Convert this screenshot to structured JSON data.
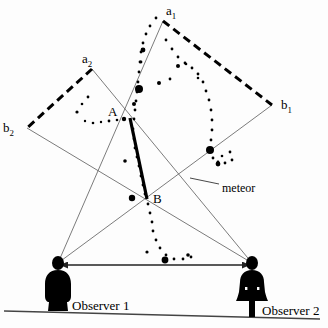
{
  "figure": {
    "background_color": "#fdfdfd",
    "ink_color": "#000000",
    "sightline_color": "#555555"
  },
  "labels": {
    "a1": {
      "base": "a",
      "sub": "1",
      "x": 166,
      "y": 4
    },
    "a2": {
      "base": "a",
      "sub": "2",
      "x": 82,
      "y": 52
    },
    "b1": {
      "base": "b",
      "sub": "1",
      "x": 281,
      "y": 98
    },
    "b2": {
      "base": "b",
      "sub": "2",
      "x": 3,
      "y": 121
    },
    "point_a": {
      "text": "A",
      "x": 108,
      "y": 105
    },
    "point_b": {
      "text": "B",
      "x": 153,
      "y": 192
    },
    "meteor": {
      "text": "meteor",
      "x": 222,
      "y": 182
    },
    "observer1": {
      "text": "Observer 1",
      "x": 72,
      "y": 299
    },
    "observer2": {
      "text": "Observer 2",
      "x": 262,
      "y": 304
    }
  },
  "geometry": {
    "observer1_head": {
      "x": 58,
      "y": 263
    },
    "observer2_head": {
      "x": 252,
      "y": 263
    },
    "point_a": {
      "x": 128,
      "y": 117
    },
    "point_b": {
      "x": 146,
      "y": 198
    },
    "vertex_a1": {
      "x": 163,
      "y": 21
    },
    "vertex_a2": {
      "x": 92,
      "y": 69
    },
    "vertex_b1": {
      "x": 272,
      "y": 105
    },
    "vertex_b2": {
      "x": 27,
      "y": 128
    },
    "ground_line": {
      "x1": 4,
      "y1": 311,
      "x2": 320,
      "y2": 319
    },
    "baseline_arrow": {
      "x1": 68,
      "y1": 265,
      "x2": 242,
      "y2": 265
    },
    "meteor_track": {
      "x1": 130,
      "y1": 118,
      "x2": 147,
      "y2": 199
    },
    "meteor_leader": {
      "x1": 190,
      "y1": 178,
      "x2": 219,
      "y2": 184
    }
  },
  "meteor_path_1": {
    "description": "dotted trail seen against background star field 1",
    "points": [
      [
        156,
        18
      ],
      [
        150,
        26
      ],
      [
        146,
        34
      ],
      [
        143,
        43
      ],
      [
        141,
        52
      ],
      [
        140,
        62
      ],
      [
        139,
        72
      ],
      [
        138,
        82
      ],
      [
        137,
        92
      ],
      [
        136,
        101
      ],
      [
        135,
        110
      ],
      [
        134,
        119
      ],
      [
        133,
        129
      ],
      [
        134,
        139
      ],
      [
        135,
        148
      ],
      [
        137,
        157
      ],
      [
        139,
        166
      ],
      [
        141,
        176
      ],
      [
        143,
        185
      ],
      [
        145,
        194
      ],
      [
        148,
        204
      ],
      [
        150,
        213
      ],
      [
        152,
        222
      ],
      [
        153,
        231
      ],
      [
        156,
        240
      ],
      [
        160,
        248
      ],
      [
        166,
        255
      ],
      [
        174,
        259
      ],
      [
        183,
        259
      ],
      [
        191,
        257
      ]
    ]
  },
  "meteor_path_2": {
    "description": "dotted trail for second viewpoint, toward right",
    "points": [
      [
        166,
        40
      ],
      [
        172,
        49
      ],
      [
        178,
        57
      ],
      [
        185,
        63
      ],
      [
        192,
        68
      ],
      [
        198,
        74
      ],
      [
        203,
        82
      ],
      [
        206,
        91
      ],
      [
        209,
        100
      ],
      [
        211,
        110
      ],
      [
        212,
        120
      ],
      [
        212,
        130
      ],
      [
        211,
        140
      ],
      [
        210,
        150
      ],
      [
        213,
        158
      ],
      [
        218,
        162
      ],
      [
        225,
        163
      ],
      [
        232,
        160
      ]
    ]
  },
  "star_field_1": {
    "description": "stars near left constellation (a2-b2 region)",
    "stars": [
      {
        "x": 88,
        "y": 97,
        "r": 1.4
      },
      {
        "x": 82,
        "y": 104,
        "r": 1.3
      },
      {
        "x": 77,
        "y": 112,
        "r": 1.6
      },
      {
        "x": 85,
        "y": 121,
        "r": 1.2
      },
      {
        "x": 93,
        "y": 123,
        "r": 1.3
      },
      {
        "x": 101,
        "y": 122,
        "r": 1.2
      },
      {
        "x": 109,
        "y": 121,
        "r": 1.4
      },
      {
        "x": 117,
        "y": 120,
        "r": 1.3
      },
      {
        "x": 124,
        "y": 119,
        "r": 2.2
      }
    ]
  },
  "star_field_2": {
    "description": "stars near right constellation (a1-b1 region)",
    "stars": [
      {
        "x": 143,
        "y": 50,
        "r": 2.4
      },
      {
        "x": 141,
        "y": 62,
        "r": 1.4
      },
      {
        "x": 139,
        "y": 89,
        "r": 4.0
      },
      {
        "x": 159,
        "y": 83,
        "r": 2.0
      },
      {
        "x": 170,
        "y": 79,
        "r": 1.4
      },
      {
        "x": 178,
        "y": 66,
        "r": 2.0
      },
      {
        "x": 186,
        "y": 64,
        "r": 1.3
      },
      {
        "x": 198,
        "y": 78,
        "r": 1.3
      },
      {
        "x": 210,
        "y": 150,
        "r": 4.0
      },
      {
        "x": 222,
        "y": 156,
        "r": 1.3
      },
      {
        "x": 230,
        "y": 152,
        "r": 1.4
      },
      {
        "x": 218,
        "y": 164,
        "r": 2.4
      },
      {
        "x": 134,
        "y": 104,
        "r": 2.0
      },
      {
        "x": 125,
        "y": 161,
        "r": 1.8
      },
      {
        "x": 132,
        "y": 198,
        "r": 3.2
      },
      {
        "x": 165,
        "y": 260,
        "r": 3.4
      },
      {
        "x": 147,
        "y": 252,
        "r": 1.6
      },
      {
        "x": 188,
        "y": 255,
        "r": 1.8
      }
    ]
  },
  "constellation_1": {
    "description": "dashed outline linking a1 to b1 (meteor seen by observer 1)",
    "path": [
      [
        163,
        21
      ],
      [
        272,
        105
      ]
    ]
  },
  "constellation_2": {
    "description": "dashed outline linking a2 to b2 (meteor seen by observer 2)",
    "path": [
      [
        92,
        69
      ],
      [
        27,
        128
      ]
    ]
  },
  "sightlines": [
    {
      "name": "obs1-to-a1",
      "from": [
        58,
        263
      ],
      "to": [
        163,
        21
      ]
    },
    {
      "name": "obs1-to-b1",
      "from": [
        58,
        263
      ],
      "to": [
        272,
        105
      ]
    },
    {
      "name": "obs2-to-a2",
      "from": [
        252,
        263
      ],
      "to": [
        92,
        69
      ]
    },
    {
      "name": "obs2-to-b2",
      "from": [
        252,
        263
      ],
      "to": [
        27,
        128
      ]
    }
  ]
}
